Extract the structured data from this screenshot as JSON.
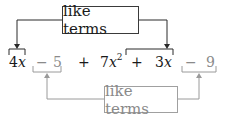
{
  "colors": {
    "dark": "#2a2a2a",
    "gray": "#9a9a9a",
    "background": "#ffffff"
  },
  "top_label": {
    "text": "like terms"
  },
  "bottom_label": {
    "text": "like terms"
  },
  "expression": {
    "terms": [
      {
        "id": "t1",
        "coef": "4",
        "var": "x",
        "exp": "",
        "group": "x-terms"
      },
      {
        "id": "op1",
        "text": "−"
      },
      {
        "id": "t2",
        "coef": "5",
        "var": "",
        "exp": "",
        "group": "constants"
      },
      {
        "id": "op2",
        "text": "+"
      },
      {
        "id": "t3",
        "coef": "7",
        "var": "x",
        "exp": "2",
        "group": "none"
      },
      {
        "id": "op3",
        "text": "+"
      },
      {
        "id": "t4",
        "coef": "3",
        "var": "x",
        "exp": "",
        "group": "x-terms"
      },
      {
        "id": "op4",
        "text": "−"
      },
      {
        "id": "t5",
        "coef": "9",
        "var": "",
        "exp": "",
        "group": "constants"
      }
    ]
  }
}
